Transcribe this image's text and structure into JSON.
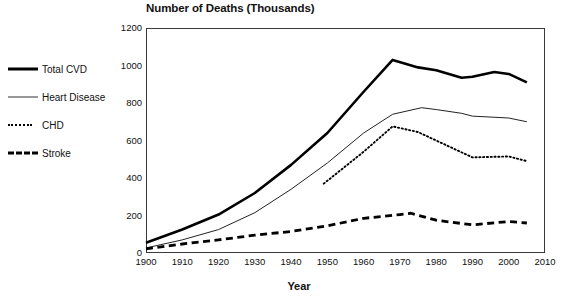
{
  "chart_data": {
    "type": "line",
    "title": "Number of Deaths (Thousands)",
    "xlabel": "Year",
    "ylabel": "",
    "xlim": [
      1900,
      2010
    ],
    "ylim": [
      0,
      1200
    ],
    "grid": false,
    "legend_position": "left-outside",
    "xticks": [
      "1900",
      "1910",
      "1920",
      "1930",
      "1940",
      "1950",
      "1960",
      "1970",
      "1980",
      "1990",
      "2000",
      "2010"
    ],
    "yticks": [
      "0",
      "200",
      "400",
      "600",
      "800",
      "1000",
      "1200"
    ],
    "series": [
      {
        "name": "Total CVD",
        "style": "solid-thick",
        "x": [
          1900,
          1910,
          1920,
          1930,
          1940,
          1950,
          1960,
          1968,
          1975,
          1980,
          1987,
          1990,
          1996,
          2000,
          2005
        ],
        "values": [
          55,
          125,
          205,
          320,
          470,
          640,
          860,
          1030,
          990,
          975,
          935,
          940,
          965,
          955,
          910
        ]
      },
      {
        "name": "Heart Disease",
        "style": "solid-thin",
        "x": [
          1900,
          1910,
          1920,
          1930,
          1940,
          1950,
          1960,
          1968,
          1976,
          1980,
          1987,
          1990,
          2000,
          2005
        ],
        "values": [
          27,
          70,
          125,
          215,
          340,
          480,
          640,
          740,
          775,
          765,
          745,
          730,
          720,
          700
        ]
      },
      {
        "name": "CHD",
        "style": "dotted",
        "x": [
          1949,
          1960,
          1968,
          1975,
          1980,
          1990,
          2000,
          2005
        ],
        "values": [
          370,
          540,
          675,
          645,
          600,
          510,
          515,
          490
        ]
      },
      {
        "name": "Stroke",
        "style": "dashed-thick",
        "x": [
          1900,
          1910,
          1920,
          1930,
          1940,
          1950,
          1960,
          1970,
          1973,
          1980,
          1990,
          2000,
          2005
        ],
        "values": [
          22,
          48,
          70,
          95,
          115,
          145,
          185,
          205,
          212,
          175,
          150,
          168,
          160
        ]
      }
    ]
  },
  "legend": {
    "items": [
      {
        "label": "Total CVD"
      },
      {
        "label": "Heart Disease"
      },
      {
        "label": "CHD"
      },
      {
        "label": "Stroke"
      }
    ]
  },
  "artifacts": {
    "bleed_left": "Heart Disease",
    "bleed_right": "Heart Disease"
  }
}
